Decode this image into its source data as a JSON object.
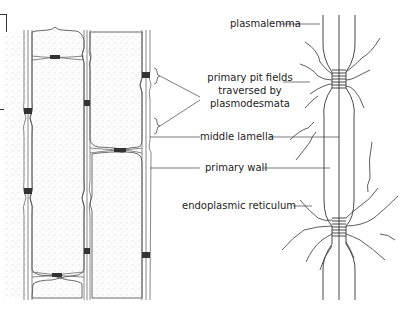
{
  "diagram": {
    "type": "plant cell wall cross-section with pit fields",
    "labels": {
      "plasmalemma": "plasmalemma",
      "pit_fields_line1": "primary pit fields",
      "pit_fields_line2": "traversed by",
      "pit_fields_line3": "plasmodesmata",
      "middle_lamella": "middle lamella",
      "primary_wall": "primary wall",
      "endoplasmic_reticulum": "endoplasmic reticulum"
    },
    "colors": {
      "line": "#333333",
      "stipple": "#bdbdbd",
      "background": "#ffffff"
    }
  }
}
